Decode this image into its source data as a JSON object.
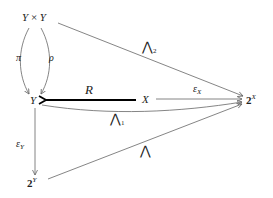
{
  "nodes": {
    "yxy": {
      "a": "Y",
      "op": "×",
      "b": "Y"
    },
    "y": {
      "label": "Y"
    },
    "x": {
      "label": "X"
    },
    "two_x": {
      "base": "2",
      "exp": "X"
    },
    "two_y": {
      "base": "2",
      "exp": "Y"
    }
  },
  "arrows": {
    "pi": {
      "label": "π"
    },
    "rho": {
      "label": "ρ"
    },
    "r": {
      "label": "R"
    },
    "eps_x": {
      "sym": "ε",
      "sub": "X"
    },
    "eps_y": {
      "sym": "ε",
      "sub": "Y"
    },
    "wedge2": {
      "sym": "⋀",
      "sub": "2"
    },
    "wedge1": {
      "sym": "⋀",
      "sub": "1"
    },
    "wedge": {
      "sym": "⋀"
    }
  },
  "colors": {
    "line": "#666666",
    "bold_arrow": "#000000",
    "text": "#222222"
  }
}
